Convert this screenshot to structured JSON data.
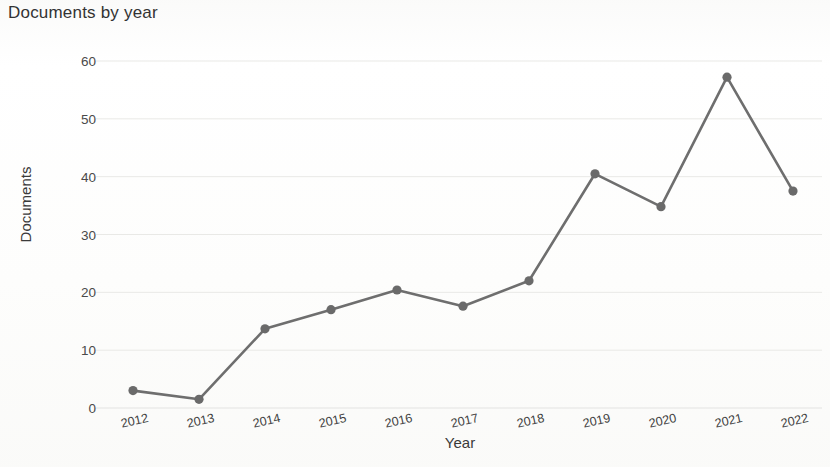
{
  "chart_data": {
    "type": "line",
    "title": "Documents by year",
    "xlabel": "Year",
    "ylabel": "Documents",
    "categories": [
      "2012",
      "2013",
      "2014",
      "2015",
      "2016",
      "2017",
      "2018",
      "2019",
      "2020",
      "2021",
      "2022"
    ],
    "values": [
      3,
      1.5,
      13.7,
      17,
      20.4,
      17.6,
      22,
      40.5,
      34.8,
      57.2,
      37.5
    ],
    "series": [
      {
        "name": "Documents",
        "values": [
          3,
          1.5,
          13.7,
          17,
          20.4,
          17.6,
          22,
          40.5,
          34.8,
          57.2,
          37.5
        ]
      }
    ],
    "ylim": [
      0,
      62
    ],
    "yticks": [
      0,
      10,
      20,
      30,
      40,
      50,
      60
    ],
    "ytick_labels": [
      "0",
      "10",
      "20",
      "30",
      "40",
      "50",
      "60"
    ],
    "xtick_labels": [
      "2012",
      "2013",
      "2014",
      "2015",
      "2016",
      "2017",
      "2018",
      "2019",
      "2020",
      "2021",
      "2022"
    ],
    "grid": true,
    "grid_axis": "y",
    "legend": false,
    "legend_position": "none",
    "marker": "circle",
    "line_color": "#6e6e6e",
    "marker_color": "#6a6a6a",
    "grid_color": "#e9e9e6",
    "background_color": "#ffffff",
    "text_color": "#3b3b3b"
  }
}
